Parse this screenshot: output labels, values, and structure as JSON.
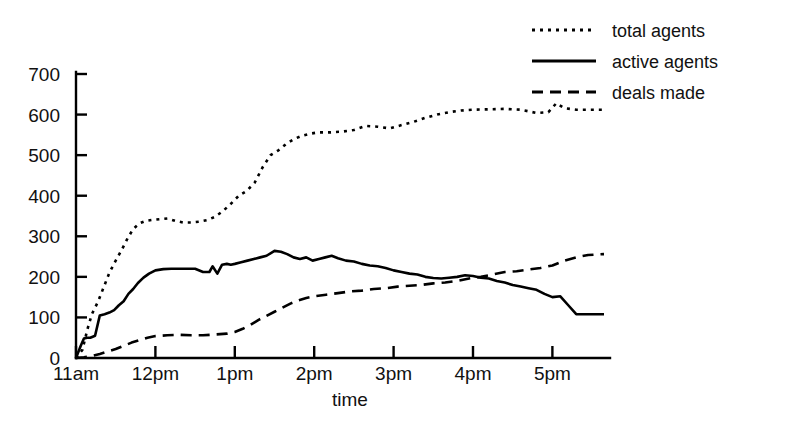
{
  "chart_data": {
    "type": "line",
    "title": "",
    "xlabel": "time",
    "ylabel": "",
    "grid": false,
    "legend_position": "top-right",
    "xlim": [
      11,
      17.65
    ],
    "ylim": [
      0,
      700
    ],
    "x_tick_labels": [
      "11am",
      "12pm",
      "1pm",
      "2pm",
      "3pm",
      "4pm",
      "5pm"
    ],
    "x_tick_values": [
      11,
      12,
      13,
      14,
      15,
      16,
      17
    ],
    "y_tick_labels": [
      "0",
      "100",
      "200",
      "300",
      "400",
      "500",
      "600",
      "700"
    ],
    "y_tick_values": [
      0,
      100,
      200,
      300,
      400,
      500,
      600,
      700
    ],
    "series": [
      {
        "name": "total agents",
        "style": "dotted",
        "x": [
          11.0,
          11.08,
          11.15,
          11.2,
          11.28,
          11.35,
          11.42,
          11.5,
          11.58,
          11.65,
          11.72,
          11.8,
          11.88,
          11.95,
          12.05,
          12.15,
          12.25,
          12.35,
          12.45,
          12.55,
          12.65,
          12.75,
          12.85,
          12.95,
          13.05,
          13.15,
          13.25,
          13.35,
          13.45,
          13.55,
          13.65,
          13.75,
          13.85,
          13.95,
          14.05,
          14.2,
          14.35,
          14.5,
          14.65,
          14.8,
          14.95,
          15.1,
          15.25,
          15.4,
          15.55,
          15.7,
          15.85,
          16.0,
          16.2,
          16.4,
          16.6,
          16.8,
          16.95,
          17.05,
          17.15,
          17.3,
          17.45,
          17.65
        ],
        "values": [
          0,
          20,
          75,
          108,
          140,
          175,
          210,
          240,
          268,
          295,
          318,
          332,
          338,
          340,
          342,
          344,
          338,
          334,
          334,
          336,
          340,
          348,
          362,
          380,
          400,
          412,
          432,
          470,
          500,
          512,
          528,
          540,
          548,
          553,
          556,
          556,
          558,
          562,
          572,
          570,
          566,
          574,
          582,
          592,
          600,
          606,
          610,
          612,
          613,
          614,
          612,
          604,
          606,
          628,
          616,
          612,
          612,
          612
        ]
      },
      {
        "name": "active agents",
        "style": "solid",
        "x": [
          11.0,
          11.06,
          11.1,
          11.14,
          11.18,
          11.24,
          11.3,
          11.36,
          11.42,
          11.48,
          11.54,
          11.6,
          11.66,
          11.72,
          11.78,
          11.85,
          11.92,
          12.0,
          12.1,
          12.2,
          12.3,
          12.4,
          12.5,
          12.6,
          12.68,
          12.72,
          12.78,
          12.84,
          12.9,
          12.95,
          13.0,
          13.08,
          13.16,
          13.24,
          13.32,
          13.4,
          13.5,
          13.58,
          13.66,
          13.74,
          13.82,
          13.9,
          13.98,
          14.06,
          14.14,
          14.22,
          14.3,
          14.4,
          14.5,
          14.6,
          14.7,
          14.8,
          14.9,
          15.0,
          15.1,
          15.2,
          15.3,
          15.4,
          15.5,
          15.6,
          15.7,
          15.8,
          15.9,
          16.0,
          16.1,
          16.2,
          16.3,
          16.4,
          16.5,
          16.6,
          16.7,
          16.8,
          16.9,
          17.0,
          17.1,
          17.2,
          17.3,
          17.45,
          17.65
        ],
        "values": [
          0,
          30,
          48,
          50,
          50,
          55,
          105,
          108,
          112,
          118,
          130,
          140,
          158,
          170,
          185,
          198,
          208,
          216,
          219,
          220,
          220,
          220,
          220,
          212,
          212,
          226,
          208,
          230,
          232,
          230,
          232,
          236,
          240,
          244,
          248,
          252,
          264,
          262,
          256,
          248,
          244,
          248,
          240,
          244,
          248,
          252,
          246,
          240,
          238,
          232,
          228,
          226,
          222,
          216,
          212,
          208,
          206,
          200,
          197,
          196,
          198,
          200,
          204,
          202,
          198,
          196,
          190,
          186,
          180,
          176,
          172,
          168,
          158,
          150,
          152,
          130,
          108,
          108,
          108
        ]
      },
      {
        "name": "deals made",
        "style": "dashed",
        "x": [
          11.0,
          11.1,
          11.2,
          11.3,
          11.4,
          11.5,
          11.6,
          11.7,
          11.8,
          11.9,
          12.0,
          12.15,
          12.3,
          12.45,
          12.6,
          12.75,
          12.9,
          13.0,
          13.1,
          13.2,
          13.3,
          13.4,
          13.5,
          13.6,
          13.7,
          13.8,
          13.9,
          14.0,
          14.15,
          14.3,
          14.45,
          14.6,
          14.75,
          14.9,
          15.05,
          15.2,
          15.35,
          15.5,
          15.65,
          15.8,
          15.95,
          16.1,
          16.25,
          16.4,
          16.55,
          16.7,
          16.85,
          17.0,
          17.15,
          17.3,
          17.45,
          17.65
        ],
        "values": [
          0,
          2,
          5,
          10,
          16,
          22,
          30,
          38,
          44,
          50,
          54,
          56,
          57,
          56,
          56,
          58,
          60,
          64,
          72,
          82,
          94,
          104,
          114,
          124,
          134,
          142,
          148,
          152,
          156,
          160,
          164,
          166,
          170,
          172,
          176,
          178,
          180,
          184,
          186,
          190,
          196,
          200,
          206,
          212,
          214,
          218,
          222,
          228,
          240,
          248,
          254,
          256
        ]
      }
    ]
  },
  "legend": {
    "items": [
      {
        "label": "total agents",
        "style": "dotted"
      },
      {
        "label": "active agents",
        "style": "solid"
      },
      {
        "label": "deals made",
        "style": "dashed"
      }
    ]
  },
  "axes": {
    "x_title": "time"
  }
}
